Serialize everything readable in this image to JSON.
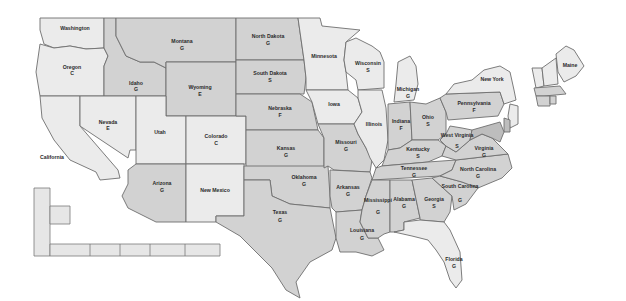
{
  "map": {
    "title": "",
    "shades": {
      "light": "#ebebeb",
      "mid": "#d2d2d2",
      "dark": "#bdbdbd",
      "border": "#6e6e6e",
      "background": "#ffffff"
    },
    "states": [
      {
        "id": "wa",
        "name": "Washington",
        "grade": "",
        "shade": "light",
        "pts": "40,18 104,18 104,48 86,49 70,46 54,48 44,44 40,30",
        "lx": 75,
        "ly": 30,
        "gx": 75,
        "gy": 36
      },
      {
        "id": "or",
        "name": "Oregon",
        "grade": "C",
        "shade": "light",
        "pts": "40,44 54,48 70,46 86,49 104,48 108,56 104,66 104,96 40,96 36,72",
        "lx": 72,
        "ly": 69,
        "gx": 72,
        "gy": 75
      },
      {
        "id": "ca",
        "name": "California",
        "grade": "",
        "shade": "light",
        "pts": "40,96 80,96 80,126 118,170 120,178 100,180 96,172 70,160 54,140 42,118",
        "lx": 52,
        "ly": 159,
        "gx": 0,
        "gy": 0
      },
      {
        "id": "id",
        "name": "Idaho",
        "grade": "G",
        "shade": "mid",
        "pts": "104,18 116,18 116,36 126,56 140,62 154,62 166,68 166,96 104,96 104,66 108,56 104,48",
        "lx": 136,
        "ly": 85,
        "gx": 136,
        "gy": 91
      },
      {
        "id": "nv",
        "name": "Nevada",
        "grade": "E",
        "shade": "light",
        "pts": "80,96 136,96 136,150 130,150 128,158 80,126",
        "lx": 108,
        "ly": 124,
        "gx": 108,
        "gy": 130
      },
      {
        "id": "mt",
        "name": "Montana",
        "grade": "G",
        "shade": "mid",
        "pts": "116,18 236,18 236,62 166,62 166,68 154,62 140,62 126,56 116,36",
        "lx": 182,
        "ly": 43,
        "gx": 182,
        "gy": 50
      },
      {
        "id": "wy",
        "name": "Wyoming",
        "grade": "E",
        "shade": "mid",
        "pts": "166,62 236,62 236,116 166,116",
        "lx": 200,
        "ly": 89,
        "gx": 200,
        "gy": 96
      },
      {
        "id": "ut",
        "name": "Utah",
        "grade": "",
        "shade": "light",
        "pts": "136,96 166,96 166,116 186,116 186,164 136,164",
        "lx": 160,
        "ly": 134,
        "gx": 0,
        "gy": 0
      },
      {
        "id": "co",
        "name": "Colorado",
        "grade": "C",
        "shade": "light",
        "pts": "186,116 246,116 246,164 186,164",
        "lx": 216,
        "ly": 138,
        "gx": 216,
        "gy": 145
      },
      {
        "id": "az",
        "name": "Arizona",
        "grade": "G",
        "shade": "mid",
        "pts": "136,164 186,164 186,222 156,222 128,208 122,196 128,184 128,170",
        "lx": 162,
        "ly": 185,
        "gx": 162,
        "gy": 192
      },
      {
        "id": "nm",
        "name": "New Mexico",
        "grade": "",
        "shade": "light",
        "pts": "186,164 244,164 244,216 216,216 216,222 186,222",
        "lx": 215,
        "ly": 192,
        "gx": 0,
        "gy": 0
      },
      {
        "id": "nd",
        "name": "North Dakota",
        "grade": "G",
        "shade": "mid",
        "pts": "236,18 298,18 304,60 236,60",
        "lx": 268,
        "ly": 38,
        "gx": 268,
        "gy": 45
      },
      {
        "id": "sd",
        "name": "South Dakota",
        "grade": "S",
        "shade": "mid",
        "pts": "236,60 304,60 306,78 304,94 236,94",
        "lx": 270,
        "ly": 75,
        "gx": 270,
        "gy": 82
      },
      {
        "id": "ne",
        "name": "Nebraska",
        "grade": "F",
        "shade": "mid",
        "pts": "236,94 300,94 312,102 318,130 246,130 246,116 236,116",
        "lx": 280,
        "ly": 110,
        "gx": 280,
        "gy": 117
      },
      {
        "id": "ks",
        "name": "Kansas",
        "grade": "G",
        "shade": "mid",
        "pts": "246,130 318,130 324,138 324,168 246,168",
        "lx": 286,
        "ly": 150,
        "gx": 286,
        "gy": 157
      },
      {
        "id": "ok",
        "name": "Oklahoma",
        "grade": "G",
        "shade": "mid",
        "pts": "244,166 328,166 330,196 330,208 310,206 290,204 272,196 270,180 244,180",
        "lx": 304,
        "ly": 179,
        "gx": 304,
        "gy": 186
      },
      {
        "id": "tx",
        "name": "Texas",
        "grade": "G",
        "shade": "mid",
        "pts": "244,180 270,180 272,196 290,204 310,206 330,208 336,238 332,250 310,262 296,282 300,298 286,290 272,268 256,252 240,236 216,222 216,216 244,216",
        "lx": 280,
        "ly": 214,
        "gx": 280,
        "gy": 222
      },
      {
        "id": "mn",
        "name": "Minnesota",
        "grade": "",
        "shade": "light",
        "pts": "298,18 320,18 322,26 360,30 346,42 344,60 346,72 348,90 306,90 306,78 304,60",
        "lx": 324,
        "ly": 58,
        "gx": 0,
        "gy": 0
      },
      {
        "id": "ia",
        "name": "Iowa",
        "grade": "",
        "shade": "light",
        "pts": "306,90 348,90 358,98 362,112 354,124 318,124 312,102",
        "lx": 334,
        "ly": 106,
        "gx": 0,
        "gy": 0
      },
      {
        "id": "mo",
        "name": "Missouri",
        "grade": "G",
        "shade": "mid",
        "pts": "318,124 354,124 358,134 366,148 372,160 370,172 334,170 328,166 324,168 324,138",
        "lx": 346,
        "ly": 144,
        "gx": 346,
        "gy": 151
      },
      {
        "id": "ar",
        "name": "Arkansas",
        "grade": "G",
        "shade": "mid",
        "pts": "330,170 370,172 372,178 366,196 362,210 336,212 332,208 330,196",
        "lx": 348,
        "ly": 189,
        "gx": 348,
        "gy": 196
      },
      {
        "id": "la",
        "name": "Louisiana",
        "grade": "G",
        "shade": "mid",
        "pts": "336,212 362,210 360,222 368,238 378,238 384,250 372,256 356,252 340,252 336,238",
        "lx": 362,
        "ly": 232,
        "gx": 362,
        "gy": 240
      },
      {
        "id": "wi",
        "name": "Wisconsin",
        "grade": "S",
        "shade": "light",
        "pts": "346,42 356,38 372,46 380,52 384,62 384,88 358,90 356,80 346,72 344,60",
        "lx": 368,
        "ly": 65,
        "gx": 368,
        "gy": 72
      },
      {
        "id": "il",
        "name": "Illinois",
        "grade": "",
        "shade": "light",
        "pts": "358,90 382,90 386,108 388,140 384,160 376,168 370,158 366,148 358,134 354,124 362,112 358,98",
        "lx": 374,
        "ly": 126,
        "gx": 0,
        "gy": 0
      },
      {
        "id": "mi",
        "name": "Michigan",
        "grade": "G",
        "shade": "light",
        "pts": "398,62 410,56 416,66 418,84 414,100 394,102 396,84",
        "lx": 408,
        "ly": 91,
        "gx": 408,
        "gy": 98
      },
      {
        "id": "in",
        "name": "Indiana",
        "grade": "F",
        "shade": "mid",
        "pts": "388,104 410,102 412,140 400,148 388,150 388,140",
        "lx": 401,
        "ly": 123,
        "gx": 401,
        "gy": 130
      },
      {
        "id": "oh",
        "name": "Ohio",
        "grade": "S",
        "shade": "mid",
        "pts": "410,102 426,104 440,98 446,112 446,134 438,140 424,140 412,140",
        "lx": 428,
        "ly": 119,
        "gx": 428,
        "gy": 126
      },
      {
        "id": "ky",
        "name": "Kentucky",
        "grade": "S",
        "shade": "mid",
        "pts": "388,150 400,148 412,140 424,140 438,140 446,146 442,156 428,162 382,166",
        "lx": 418,
        "ly": 151,
        "gx": 418,
        "gy": 158
      },
      {
        "id": "tn",
        "name": "Tennessee",
        "grade": "G",
        "shade": "mid",
        "pts": "376,168 382,166 428,162 456,160 452,170 440,176 372,180",
        "lx": 414,
        "ly": 170,
        "gx": 414,
        "gy": 177
      },
      {
        "id": "ms",
        "name": "Mississippi",
        "grade": "G",
        "shade": "mid",
        "pts": "372,180 390,180 390,232 384,234 378,238 368,238 360,222 362,210 366,196",
        "lx": 378,
        "ly": 202,
        "gx": 378,
        "gy": 214
      },
      {
        "id": "al",
        "name": "Alabama",
        "grade": "G",
        "shade": "mid",
        "pts": "390,180 412,180 420,218 404,222 404,230 394,232 390,232",
        "lx": 404,
        "ly": 201,
        "gx": 404,
        "gy": 208
      },
      {
        "id": "ga",
        "name": "Georgia",
        "grade": "S",
        "shade": "mid",
        "pts": "412,180 432,178 452,196 450,212 444,222 420,220 420,218",
        "lx": 434,
        "ly": 201,
        "gx": 434,
        "gy": 208
      },
      {
        "id": "fl",
        "name": "Florida",
        "grade": "G",
        "shade": "light",
        "pts": "394,232 404,230 404,222 420,220 444,222 450,230 460,252 462,280 456,288 450,280 444,262 436,250 428,240 412,236",
        "lx": 454,
        "ly": 261,
        "gx": 454,
        "gy": 268
      },
      {
        "id": "sc",
        "name": "South Carolina",
        "grade": "G",
        "shade": "mid",
        "pts": "440,176 462,182 478,188 466,204 454,210 452,196 432,178",
        "lx": 460,
        "ly": 188,
        "gx": 460,
        "gy": 202
      },
      {
        "id": "nc",
        "name": "North Carolina",
        "grade": "G",
        "shade": "mid",
        "pts": "452,170 456,160 508,154 512,168 502,178 478,188 462,182 440,176",
        "lx": 478,
        "ly": 171,
        "gx": 478,
        "gy": 178
      },
      {
        "id": "va",
        "name": "Virginia",
        "grade": "G",
        "shade": "mid",
        "pts": "442,156 446,146 456,152 470,140 482,134 492,138 500,146 508,154 456,160",
        "lx": 484,
        "ly": 150,
        "gx": 484,
        "gy": 157
      },
      {
        "id": "wv",
        "name": "West Virginia",
        "grade": "S",
        "shade": "mid",
        "pts": "446,134 450,126 462,128 472,130 470,140 456,152 446,146 440,140",
        "lx": 457,
        "ly": 137,
        "gx": 457,
        "gy": 148
      },
      {
        "id": "pa",
        "name": "Pennsylvania",
        "grade": "F",
        "shade": "mid",
        "pts": "440,98 446,94 500,92 504,104 498,116 448,120 446,112",
        "lx": 474,
        "ly": 105,
        "gx": 474,
        "gy": 112
      },
      {
        "id": "ny",
        "name": "New York",
        "grade": "",
        "shade": "light",
        "pts": "446,94 454,84 472,80 484,70 500,66 510,72 514,90 516,100 504,104 500,92",
        "lx": 492,
        "ly": 81,
        "gx": 0,
        "gy": 0
      },
      {
        "id": "me",
        "name": "Maine",
        "grade": "",
        "shade": "light",
        "pts": "556,54 566,46 574,50 584,66 576,76 564,82 558,72",
        "lx": 570,
        "ly": 67,
        "gx": 0,
        "gy": 0
      },
      {
        "id": "vt",
        "name": "Vermont",
        "grade": "",
        "shade": "light",
        "pts": "532,68 542,68 544,86 536,88",
        "lx": 0,
        "ly": 0,
        "gx": 0,
        "gy": 0
      },
      {
        "id": "nh",
        "name": "New Hampshire",
        "grade": "",
        "shade": "light",
        "pts": "542,68 556,58 558,84 544,86",
        "lx": 0,
        "ly": 0,
        "gx": 0,
        "gy": 0
      },
      {
        "id": "ma",
        "name": "Massachusetts",
        "grade": "",
        "shade": "mid",
        "pts": "534,88 560,86 566,94 544,96 536,96",
        "lx": 0,
        "ly": 0,
        "gx": 0,
        "gy": 0
      },
      {
        "id": "ct",
        "name": "Connecticut",
        "grade": "",
        "shade": "mid",
        "pts": "536,96 550,96 550,106 538,106",
        "lx": 0,
        "ly": 0,
        "gx": 0,
        "gy": 0
      },
      {
        "id": "ri",
        "name": "Rhode Island",
        "grade": "",
        "shade": "mid",
        "pts": "550,96 556,96 556,104 550,104",
        "lx": 0,
        "ly": 0,
        "gx": 0,
        "gy": 0
      },
      {
        "id": "nj",
        "name": "New Jersey",
        "grade": "",
        "shade": "light",
        "pts": "510,104 518,106 518,124 510,128 508,116",
        "lx": 0,
        "ly": 0,
        "gx": 0,
        "gy": 0
      },
      {
        "id": "de",
        "name": "Delaware",
        "grade": "",
        "shade": "dark",
        "pts": "504,118 510,120 510,132 504,132",
        "lx": 0,
        "ly": 0,
        "gx": 0,
        "gy": 0
      },
      {
        "id": "md",
        "name": "Maryland",
        "grade": "",
        "shade": "dark",
        "pts": "472,130 500,122 504,132 500,142 492,138 482,134 470,140",
        "lx": 0,
        "ly": 0,
        "gx": 0,
        "gy": 0
      }
    ],
    "insets": {
      "alaska_box": "34,188 50,188 50,256 34,256",
      "hawaii_box": "50,206 70,206 70,224 50,224",
      "islands_strip": "50,244 220,244 220,256 50,256"
    }
  }
}
